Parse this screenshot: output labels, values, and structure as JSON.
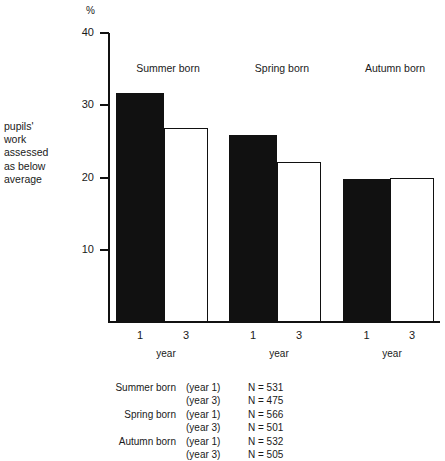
{
  "chart_data": {
    "type": "bar",
    "title": "",
    "subtitle": "",
    "unit_symbol": "%",
    "ylabel": "pupils' work assessed as below average",
    "ylabel_lines": [
      "pupils'",
      "work",
      "assessed",
      "as below",
      "average"
    ],
    "xlabel": "year",
    "ylim": [
      0,
      40
    ],
    "yticks": [
      10,
      20,
      30,
      40
    ],
    "ytick_labels": [
      "10",
      "20",
      "30",
      "40"
    ],
    "grid": false,
    "legend_position": "none",
    "categories": [
      "Summer born",
      "Spring born",
      "Autumn born"
    ],
    "series": [
      {
        "name": "year 1",
        "style": "filled",
        "values": [
          31.7,
          25.9,
          19.8
        ]
      },
      {
        "name": "year 3",
        "style": "hollow",
        "values": [
          26.8,
          22.1,
          19.9
        ]
      }
    ],
    "x_tick_labels": [
      "1",
      "3",
      "1",
      "3",
      "1",
      "3"
    ],
    "group_axis_label": "year",
    "annotations": []
  },
  "groups": [
    {
      "header": "Summer born",
      "axis_label": "year",
      "bars": [
        {
          "tick": "1",
          "value": 31.7,
          "style": "filled"
        },
        {
          "tick": "3",
          "value": 26.8,
          "style": "hollow"
        }
      ]
    },
    {
      "header": "Spring born",
      "axis_label": "year",
      "bars": [
        {
          "tick": "1",
          "value": 25.9,
          "style": "filled"
        },
        {
          "tick": "3",
          "value": 22.1,
          "style": "hollow"
        }
      ]
    },
    {
      "header": "Autumn born",
      "axis_label": "year",
      "bars": [
        {
          "tick": "1",
          "value": 19.8,
          "style": "filled"
        },
        {
          "tick": "3",
          "value": 19.9,
          "style": "hollow"
        }
      ]
    }
  ],
  "axis": {
    "unit": "%",
    "ticks": [
      {
        "label": "40",
        "value": 40
      },
      {
        "label": "30",
        "value": 30
      },
      {
        "label": "20",
        "value": 20
      },
      {
        "label": "10",
        "value": 10
      }
    ]
  },
  "notes": {
    "rows": [
      {
        "group": "Summer born",
        "year": "(year 1)",
        "n": "N = 531"
      },
      {
        "group": "",
        "year": "(year 3)",
        "n": "N = 475"
      },
      {
        "group": "Spring born",
        "year": "(year 1)",
        "n": "N = 566"
      },
      {
        "group": "",
        "year": "(year 3)",
        "n": "N = 501"
      },
      {
        "group": "Autumn born",
        "year": "(year 1)",
        "n": "N = 532"
      },
      {
        "group": "",
        "year": "(year 3)",
        "n": "N = 505"
      }
    ]
  },
  "colors": {
    "ink": "#111111",
    "paper": "#ffffff",
    "bar_filled": "#111111",
    "bar_hollow": "#ffffff"
  }
}
